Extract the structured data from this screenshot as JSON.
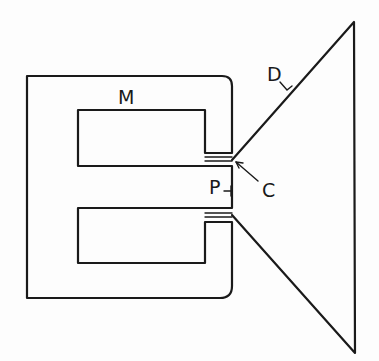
{
  "diagram": {
    "type": "technical-schematic",
    "labels": {
      "magnet": "M",
      "diaphragm": "D",
      "pole_piece": "P",
      "coil_gap": "C"
    },
    "colors": {
      "ink": "#1a1a1a",
      "paper": "#fdfdfd"
    }
  }
}
